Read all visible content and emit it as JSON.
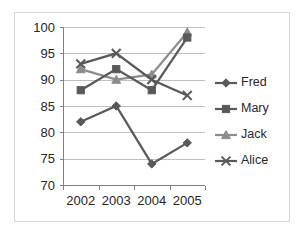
{
  "chart_data": {
    "type": "line",
    "title": "",
    "xlabel": "",
    "ylabel": "",
    "categories": [
      "2002",
      "2003",
      "2004",
      "2005"
    ],
    "x": [
      2002,
      2003,
      2004,
      2005
    ],
    "ylim": [
      70,
      100
    ],
    "yticks": [
      70,
      75,
      80,
      85,
      90,
      95,
      100
    ],
    "ytick_labels": [
      "70",
      "75",
      "80",
      "85",
      "90",
      "95",
      "100"
    ],
    "xtick_labels": [
      "2002",
      "2003",
      "2004",
      "2005"
    ],
    "grid": "horizontal",
    "legend_position": "right",
    "series": [
      {
        "name": "Fred",
        "values": [
          82,
          85,
          74,
          78
        ],
        "color": "#595959",
        "marker": "diamond"
      },
      {
        "name": "Mary",
        "values": [
          88,
          92,
          88,
          98
        ],
        "color": "#595959",
        "marker": "square"
      },
      {
        "name": "Jack",
        "values": [
          92,
          90,
          91,
          99
        ],
        "color": "#8c8c8c",
        "marker": "triangle"
      },
      {
        "name": "Alice",
        "values": [
          93,
          95,
          90,
          87
        ],
        "color": "#595959",
        "marker": "x"
      }
    ]
  },
  "legend": {
    "items": [
      {
        "label": "Fred",
        "marker_icon": "diamond-marker-icon"
      },
      {
        "label": "Mary",
        "marker_icon": "square-marker-icon"
      },
      {
        "label": "Jack",
        "marker_icon": "triangle-marker-icon"
      },
      {
        "label": "Alice",
        "marker_icon": "x-marker-icon"
      }
    ]
  },
  "axes": {
    "y_labels": [
      "100",
      "95",
      "90",
      "85",
      "80",
      "75",
      "70"
    ],
    "x_labels": [
      "2002",
      "2003",
      "2004",
      "2005"
    ]
  },
  "colors": {
    "frame": "#d9d9d9",
    "gridline": "#bfbfbf",
    "axis": "#7f7f7f",
    "text": "#262626",
    "series_dark": "#595959",
    "series_light": "#8c8c8c",
    "background": "#ffffff"
  }
}
